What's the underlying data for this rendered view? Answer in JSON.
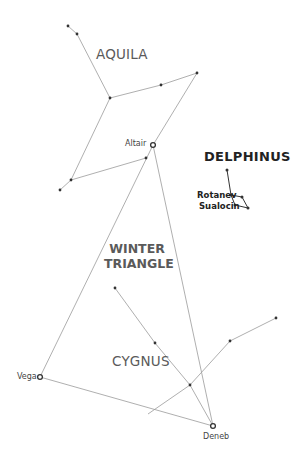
{
  "diagram": {
    "constellations": [
      {
        "name": "AQUILA"
      },
      {
        "name": "DELPHINUS"
      },
      {
        "name": "CYGNUS"
      }
    ],
    "asterism": {
      "line1": "WINTER",
      "line2": "TRIANGLE"
    },
    "bright_stars": [
      {
        "name": "Altair",
        "x": 153,
        "y": 145
      },
      {
        "name": "Vega",
        "x": 40,
        "y": 377
      },
      {
        "name": "Deneb",
        "x": 213,
        "y": 426
      }
    ],
    "delphinus_stars": [
      {
        "name": "Rotanev"
      },
      {
        "name": "Sualocin"
      }
    ],
    "colors": {
      "line": "#9a9a9a",
      "star": "#333333",
      "label": "#5a5a5a",
      "bold_label": "#222222"
    }
  }
}
